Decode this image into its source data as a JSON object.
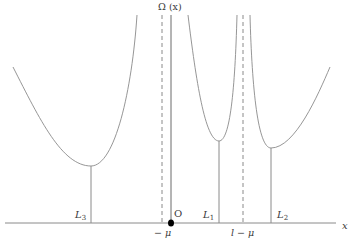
{
  "diagram": {
    "y_axis_label": "Ω (x)",
    "x_axis_label": "x",
    "origin_label": "O",
    "asymptote_labels": {
      "neg_mu": "− μ",
      "l_minus_mu": "l − μ"
    },
    "lagrange_points": {
      "L1": {
        "letter": "L",
        "sub": "1"
      },
      "L2": {
        "letter": "L",
        "sub": "2"
      },
      "L3": {
        "letter": "L",
        "sub": "3"
      }
    },
    "colors": {
      "line": "#8a8a8a",
      "text": "#3a3a3a",
      "dot": "#000000"
    }
  }
}
